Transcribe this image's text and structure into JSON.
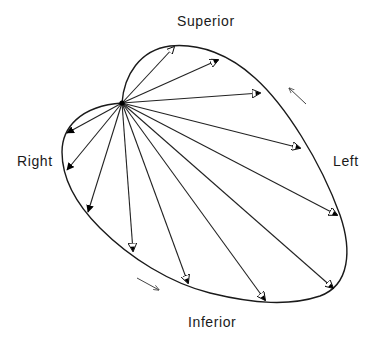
{
  "figure": {
    "type": "vectorcardiogram loop diagram",
    "labels": {
      "superior": "Superior",
      "left": "Left",
      "right": "Right",
      "inferior": "Inferior"
    },
    "origin": {
      "x": 122,
      "y": 103
    },
    "colors": {
      "line": "#1a1a1a",
      "background": "#ffffff",
      "arrowhead_fill": "#000000",
      "arrowhead_open": "#ffffff"
    },
    "rotation_direction": "counterclockwise",
    "vectors": [
      {
        "id": 1,
        "x": 174,
        "y": 47,
        "head": "open"
      },
      {
        "id": 2,
        "x": 218,
        "y": 60,
        "head": "half"
      },
      {
        "id": 3,
        "x": 260,
        "y": 93,
        "head": "half"
      },
      {
        "id": 4,
        "x": 300,
        "y": 148,
        "head": "half"
      },
      {
        "id": 5,
        "x": 337,
        "y": 215,
        "head": "half"
      },
      {
        "id": 6,
        "x": 333,
        "y": 288,
        "head": "half"
      },
      {
        "id": 7,
        "x": 265,
        "y": 300,
        "head": "half"
      },
      {
        "id": 8,
        "x": 188,
        "y": 283,
        "head": "half"
      },
      {
        "id": 9,
        "x": 133,
        "y": 251,
        "head": "half"
      },
      {
        "id": 10,
        "x": 88,
        "y": 212,
        "head": "solid"
      },
      {
        "id": 11,
        "x": 67,
        "y": 170,
        "head": "solid"
      },
      {
        "id": 12,
        "x": 67,
        "y": 133,
        "head": "solid"
      }
    ],
    "direction_arrows": [
      {
        "name": "upper-right-direction-arrow",
        "from": [
          306,
          104
        ],
        "to": [
          288,
          87
        ]
      },
      {
        "name": "lower-left-direction-arrow",
        "from": [
          137,
          278
        ],
        "to": [
          160,
          290
        ]
      }
    ]
  }
}
